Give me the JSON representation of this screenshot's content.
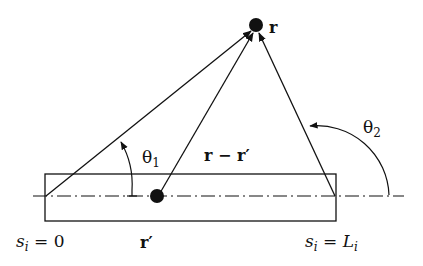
{
  "diagram": {
    "labels": {
      "field_point": "r",
      "source_point": "r′",
      "difference_vector": "r − r′",
      "theta1": "θ",
      "theta1_sub": "1",
      "theta2": "θ",
      "theta2_sub": "2",
      "start_s": "s",
      "start_sub": "i",
      "start_eq": " = 0",
      "end_s": "s",
      "end_sub": "i",
      "end_eq": " = ",
      "end_L": "L",
      "end_L_sub": "i"
    },
    "colors": {
      "stroke": "#111111",
      "background": "#ffffff"
    }
  }
}
